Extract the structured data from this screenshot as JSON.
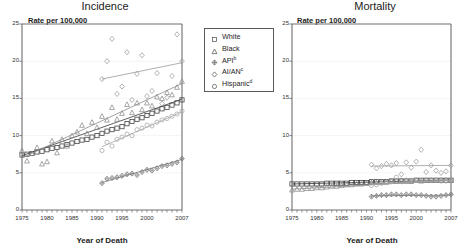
{
  "figure": {
    "panels": [
      {
        "key": "incidence",
        "title": "Incidence",
        "ylabel": "Rate per 100,000",
        "xlabel": "Year of Death"
      },
      {
        "key": "mortality",
        "title": "Mortality",
        "ylabel": "Rate per 100,000",
        "xlabel": "Year of Death"
      }
    ]
  },
  "legend": {
    "items": [
      {
        "label": "White",
        "sup": "",
        "marker": "square"
      },
      {
        "label": "Black",
        "sup": "",
        "marker": "triangle"
      },
      {
        "label": "API",
        "sup": "b",
        "marker": "diamond-filled"
      },
      {
        "label": "AI/AN",
        "sup": "c",
        "marker": "diamond"
      },
      {
        "label": "Hispanic",
        "sup": "d",
        "marker": "circle"
      }
    ]
  },
  "chart_data": [
    {
      "type": "scatter",
      "title": "Incidence",
      "xlabel": "Year of Death",
      "ylabel": "Rate per 100,000",
      "xlim": [
        1975,
        2007
      ],
      "ylim": [
        0,
        25
      ],
      "yticks": [
        0,
        5,
        10,
        15,
        20,
        25
      ],
      "xticks": [
        1975,
        1980,
        1985,
        1990,
        1995,
        2000,
        2007
      ],
      "xtick_step": 1,
      "grid": true,
      "legend_position": "outside-right-top",
      "x": [
        1975,
        1976,
        1977,
        1978,
        1979,
        1980,
        1981,
        1982,
        1983,
        1984,
        1985,
        1986,
        1987,
        1988,
        1989,
        1990,
        1991,
        1992,
        1993,
        1994,
        1995,
        1996,
        1997,
        1998,
        1999,
        2000,
        2001,
        2002,
        2003,
        2004,
        2005,
        2006,
        2007
      ],
      "series": [
        {
          "name": "White",
          "marker": "square",
          "values": [
            7.4,
            7.5,
            7.6,
            7.8,
            7.9,
            8.1,
            8.3,
            8.4,
            8.6,
            8.8,
            9.0,
            9.2,
            9.4,
            9.5,
            9.8,
            10.0,
            10.3,
            10.6,
            10.8,
            11.0,
            11.2,
            11.6,
            11.9,
            12.2,
            12.4,
            12.7,
            13.0,
            13.3,
            13.6,
            13.8,
            14.1,
            14.4,
            14.8
          ],
          "trend": [
            7.3,
            14.9
          ]
        },
        {
          "name": "Black",
          "marker": "triangle",
          "values": [
            8.0,
            6.6,
            7.6,
            8.4,
            6.2,
            6.5,
            9.3,
            7.7,
            9.5,
            8.6,
            10.0,
            10.5,
            11.4,
            10.3,
            11.8,
            11.1,
            12.6,
            12.1,
            13.8,
            12.2,
            13.0,
            14.2,
            13.1,
            14.4,
            13.5,
            14.4,
            14.0,
            15.2,
            15.0,
            15.8,
            15.5,
            16.5,
            17.3
          ],
          "trend": [
            7.0,
            17.0
          ]
        },
        {
          "name": "API",
          "marker": "diamond-filled",
          "values": [
            null,
            null,
            null,
            null,
            null,
            null,
            null,
            null,
            null,
            null,
            null,
            null,
            null,
            null,
            null,
            null,
            3.6,
            4.2,
            4.3,
            4.4,
            4.6,
            4.8,
            4.9,
            4.7,
            5.1,
            5.4,
            5.3,
            5.6,
            5.9,
            6.0,
            6.2,
            6.4,
            6.9
          ],
          "trend_start_year": 1991,
          "trend": [
            3.7,
            6.8
          ]
        },
        {
          "name": "AI/AN",
          "marker": "diamond",
          "values": [
            null,
            null,
            null,
            null,
            null,
            null,
            null,
            null,
            null,
            null,
            null,
            null,
            null,
            null,
            null,
            null,
            17.6,
            20.0,
            23.0,
            15.6,
            16.6,
            21.2,
            14.8,
            18.3,
            20.8,
            15.3,
            16.0,
            18.4,
            14.3,
            15.1,
            18.0,
            23.6,
            20.0
          ],
          "trend_start_year": 1991,
          "trend": [
            17.6,
            19.8
          ]
        },
        {
          "name": "Hispanic",
          "marker": "circle",
          "values": [
            null,
            null,
            null,
            null,
            null,
            null,
            null,
            null,
            null,
            null,
            null,
            null,
            null,
            null,
            null,
            null,
            8.0,
            9.1,
            8.6,
            9.5,
            9.8,
            10.2,
            10.0,
            10.8,
            11.0,
            11.4,
            11.3,
            11.8,
            12.1,
            12.3,
            12.6,
            12.9,
            13.3
          ],
          "trend_start_year": 1991,
          "trend": [
            8.5,
            13.2
          ]
        }
      ]
    },
    {
      "type": "scatter",
      "title": "Mortality",
      "xlabel": "Year of Death",
      "ylabel": "Rate per 100,000",
      "xlim": [
        1975,
        2007
      ],
      "ylim": [
        0,
        25
      ],
      "yticks": [
        0,
        5,
        10,
        15,
        20,
        25
      ],
      "xticks": [
        1975,
        1980,
        1985,
        1990,
        1995,
        2000,
        2007
      ],
      "xtick_step": 1,
      "grid": true,
      "legend_position": "none",
      "x": [
        1975,
        1976,
        1977,
        1978,
        1979,
        1980,
        1981,
        1982,
        1983,
        1984,
        1985,
        1986,
        1987,
        1988,
        1989,
        1990,
        1991,
        1992,
        1993,
        1994,
        1995,
        1996,
        1997,
        1998,
        1999,
        2000,
        2001,
        2002,
        2003,
        2004,
        2005,
        2006,
        2007
      ],
      "series": [
        {
          "name": "White",
          "marker": "square",
          "values": [
            3.5,
            3.5,
            3.5,
            3.5,
            3.5,
            3.5,
            3.5,
            3.6,
            3.6,
            3.6,
            3.6,
            3.6,
            3.7,
            3.7,
            3.7,
            3.7,
            3.8,
            3.8,
            3.8,
            3.8,
            3.9,
            3.9,
            3.9,
            3.9,
            3.9,
            4.0,
            4.0,
            4.0,
            4.0,
            4.0,
            4.0,
            4.0,
            4.0
          ],
          "trend": [
            3.5,
            4.0
          ]
        },
        {
          "name": "Black",
          "marker": "triangle",
          "values": [
            2.7,
            2.8,
            2.8,
            2.9,
            2.9,
            3.0,
            3.0,
            3.1,
            3.2,
            3.2,
            3.3,
            3.4,
            3.4,
            3.5,
            3.5,
            3.6,
            3.7,
            3.7,
            3.8,
            3.8,
            3.9,
            3.9,
            4.0,
            4.0,
            3.9,
            4.0,
            3.9,
            4.0,
            4.0,
            4.0,
            4.0,
            4.0,
            4.0
          ],
          "trend": [
            2.8,
            4.0
          ]
        },
        {
          "name": "API",
          "marker": "diamond-filled",
          "values": [
            null,
            null,
            null,
            null,
            null,
            null,
            null,
            null,
            null,
            null,
            null,
            null,
            null,
            null,
            null,
            null,
            1.8,
            1.9,
            2.0,
            2.0,
            2.1,
            2.1,
            2.0,
            2.1,
            2.1,
            2.0,
            2.0,
            1.9,
            1.8,
            1.8,
            1.9,
            2.0,
            2.1
          ],
          "trend_start_year": 1991,
          "trend": [
            1.9,
            2.0
          ]
        },
        {
          "name": "AI/AN",
          "marker": "diamond",
          "values": [
            null,
            null,
            null,
            null,
            null,
            null,
            null,
            null,
            null,
            null,
            null,
            null,
            null,
            null,
            null,
            null,
            6.1,
            5.6,
            5.9,
            6.2,
            6.0,
            6.3,
            4.8,
            6.4,
            5.7,
            6.5,
            8.1,
            5.1,
            6.0,
            5.3,
            5.0,
            5.2,
            6.0
          ],
          "trend_start_year": 1991,
          "trend": [
            5.9,
            6.0
          ]
        },
        {
          "name": "Hispanic",
          "marker": "circle",
          "values": [
            null,
            null,
            null,
            null,
            null,
            null,
            null,
            null,
            null,
            null,
            null,
            null,
            null,
            null,
            null,
            null,
            3.3,
            3.4,
            3.6,
            3.7,
            3.8,
            4.4,
            3.8,
            3.9,
            4.0,
            4.0,
            4.0,
            4.0,
            4.0,
            4.0,
            3.9,
            3.9,
            4.0
          ],
          "trend_start_year": 1991,
          "trend": [
            3.4,
            4.0
          ]
        }
      ]
    }
  ]
}
